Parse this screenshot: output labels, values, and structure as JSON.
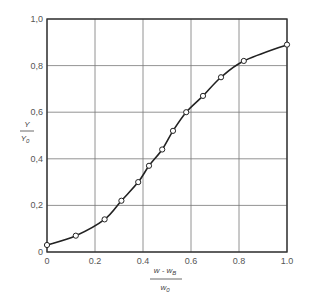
{
  "chart_data": {
    "type": "line",
    "title": "",
    "xlabel": "(w - w_B) / w_0",
    "ylabel": "Y / Y_0",
    "xlabel_parts": {
      "num": "w - w",
      "num_sub": "B",
      "den": "w",
      "den_sub": "0"
    },
    "ylabel_parts": {
      "num": "Y",
      "den": "Y",
      "den_sub": "0"
    },
    "xlim": [
      0,
      1.0
    ],
    "ylim": [
      0,
      1.0
    ],
    "grid": true,
    "markers": "open-circle",
    "x_ticks": [
      {
        "value": 0,
        "label": "0"
      },
      {
        "value": 0.2,
        "label": "0.2"
      },
      {
        "value": 0.4,
        "label": "0.4"
      },
      {
        "value": 0.6,
        "label": "0.6"
      },
      {
        "value": 0.8,
        "label": "0.8"
      },
      {
        "value": 1.0,
        "label": "1.0"
      }
    ],
    "y_ticks": [
      {
        "value": 0,
        "label": "0"
      },
      {
        "value": 0.2,
        "label": "0,2"
      },
      {
        "value": 0.4,
        "label": "0,4"
      },
      {
        "value": 0.6,
        "label": "0,6"
      },
      {
        "value": 0.8,
        "label": "0,8"
      },
      {
        "value": 1.0,
        "label": "1,0"
      }
    ],
    "series": [
      {
        "name": "Y/Y0",
        "x": [
          0.0,
          0.12,
          0.24,
          0.31,
          0.38,
          0.425,
          0.48,
          0.525,
          0.58,
          0.65,
          0.725,
          0.82,
          1.0
        ],
        "values": [
          0.03,
          0.07,
          0.14,
          0.22,
          0.3,
          0.37,
          0.44,
          0.52,
          0.6,
          0.67,
          0.75,
          0.82,
          0.89
        ]
      }
    ]
  }
}
